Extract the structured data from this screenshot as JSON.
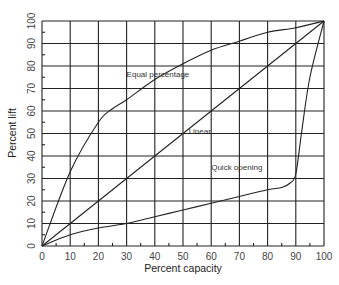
{
  "chart_data": {
    "type": "line",
    "title": "",
    "xlabel": "Percent capacity",
    "ylabel": "Percent lift",
    "xlim": [
      0,
      100
    ],
    "ylim": [
      0,
      100
    ],
    "grid": true,
    "legend": "none (inline annotations)",
    "x_ticks": [
      "0",
      "10",
      "20",
      "30",
      "40",
      "50",
      "60",
      "70",
      "80",
      "90",
      "100"
    ],
    "y_ticks": [
      "0",
      "10",
      "20",
      "30",
      "40",
      "50",
      "60",
      "70",
      "80",
      "90",
      "100"
    ],
    "series": [
      {
        "name": "Equal percentage",
        "x": [
          0,
          10,
          20,
          25,
          30,
          40,
          50,
          60,
          70,
          80,
          90,
          100
        ],
        "y": [
          0,
          33,
          55,
          61,
          65,
          74,
          81,
          87,
          91,
          95,
          97,
          100
        ]
      },
      {
        "name": "Linear",
        "x": [
          0,
          100
        ],
        "y": [
          0,
          100
        ]
      },
      {
        "name": "Quick opening",
        "x": [
          0,
          10,
          20,
          30,
          40,
          50,
          60,
          70,
          80,
          85,
          88,
          90,
          92,
          95,
          100
        ],
        "y": [
          0,
          5,
          8,
          10,
          13,
          16,
          19,
          22,
          25,
          26,
          28,
          32,
          50,
          75,
          100
        ]
      }
    ],
    "annotations": [
      {
        "text": "Equal percentage",
        "x": 30,
        "y": 75
      },
      {
        "text": "Linear",
        "x": 52,
        "y": 50
      },
      {
        "text": "Quick opening",
        "x": 60,
        "y": 34
      }
    ]
  }
}
